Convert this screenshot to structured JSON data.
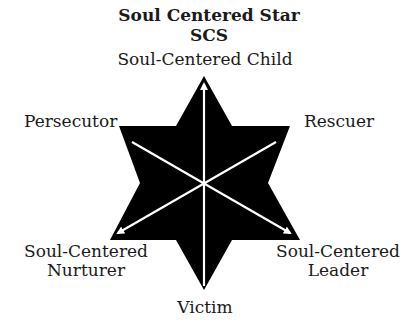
{
  "title": "Soul Centered Star",
  "subtitle": "SCS",
  "labels": {
    "top": "Soul-Centered Child",
    "upper_left": "Persecutor",
    "upper_right": "Rescuer",
    "lower_left_line1": "Soul-Centered",
    "lower_left_line2": "Nurturer",
    "lower_right_line1": "Soul-Centered",
    "lower_right_line2": "Leader",
    "bottom": "Victim"
  },
  "colors": {
    "star": "#000000",
    "arrows": "#ffffff",
    "text": "#1a1a1a"
  }
}
